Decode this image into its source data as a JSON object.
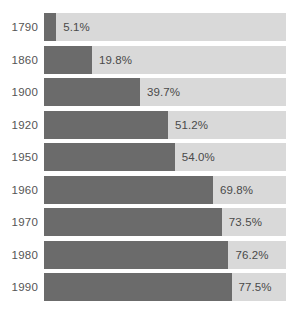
{
  "chart_data": {
    "type": "bar",
    "orientation": "horizontal",
    "title": "",
    "subtitle": "",
    "xlabel": "",
    "ylabel": "",
    "xlim": [
      0,
      100
    ],
    "grid": false,
    "legend": null,
    "value_suffix": "%",
    "categories": [
      "1790",
      "1860",
      "1900",
      "1920",
      "1950",
      "1960",
      "1970",
      "1980",
      "1990"
    ],
    "values": [
      5.1,
      19.8,
      39.7,
      51.2,
      54.0,
      69.8,
      73.5,
      76.2,
      77.5
    ],
    "value_labels": [
      "5.1%",
      "19.8%",
      "39.7%",
      "51.2%",
      "54.0%",
      "69.8%",
      "73.5%",
      "76.2%",
      "77.5%"
    ],
    "colors": {
      "bar_fill": "#6b6b6b",
      "bar_track": "#d9d9d9",
      "background": "#ffffff",
      "label_text": "#555555",
      "value_text": "#4a4a4a"
    },
    "rows": [
      {
        "category": "1790",
        "value": 5.1,
        "value_label": "5.1%"
      },
      {
        "category": "1860",
        "value": 19.8,
        "value_label": "19.8%"
      },
      {
        "category": "1900",
        "value": 39.7,
        "value_label": "39.7%"
      },
      {
        "category": "1920",
        "value": 51.2,
        "value_label": "51.2%"
      },
      {
        "category": "1950",
        "value": 54.0,
        "value_label": "54.0%"
      },
      {
        "category": "1960",
        "value": 69.8,
        "value_label": "69.8%"
      },
      {
        "category": "1970",
        "value": 73.5,
        "value_label": "73.5%"
      },
      {
        "category": "1980",
        "value": 76.2,
        "value_label": "76.2%"
      },
      {
        "category": "1990",
        "value": 77.5,
        "value_label": "77.5%"
      }
    ]
  },
  "layout": {
    "track_left": 44,
    "track_width": 242,
    "row_top": 13,
    "row_pitch": 32.5,
    "bar_height": 28
  }
}
